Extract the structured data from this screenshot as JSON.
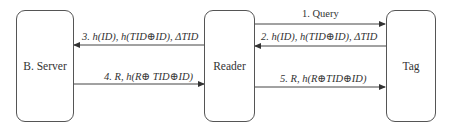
{
  "diagram": {
    "nodes": [
      {
        "id": "server",
        "label": "B. Server"
      },
      {
        "id": "reader",
        "label": "Reader"
      },
      {
        "id": "tag",
        "label": "Tag"
      }
    ],
    "messages": [
      {
        "step": 1,
        "from": "reader",
        "to": "tag",
        "text": "1. Query"
      },
      {
        "step": 2,
        "from": "tag",
        "to": "reader",
        "text": "2. h(ID), h(TID⊕ID), ΔTID"
      },
      {
        "step": 3,
        "from": "reader",
        "to": "server",
        "text": "3. h(ID), h(TID⊕ID), ΔTID"
      },
      {
        "step": 4,
        "from": "server",
        "to": "reader",
        "text": "4. R, h(R⊕ TID⊕ID)"
      },
      {
        "step": 5,
        "from": "reader",
        "to": "tag",
        "text": "5. R, h(R⊕TID⊕ID)"
      }
    ]
  }
}
